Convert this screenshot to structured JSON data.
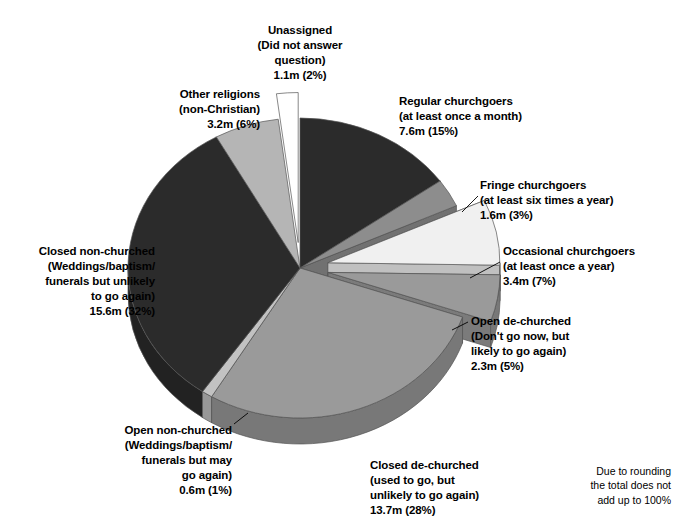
{
  "chart_data": {
    "type": "pie",
    "title": "",
    "subtitle": "",
    "xlabel": "",
    "ylabel": "",
    "legend_position": "callout-labels",
    "grid": false,
    "exploded": true,
    "three_d": true,
    "units": "millions of people",
    "start_angle_deg": 0,
    "direction": "clockwise",
    "categories": [
      "Regular churchgoers",
      "Fringe churchgoers",
      "Occasional churchgoers",
      "Open de-churched",
      "Closed de-churched",
      "Open non-churched",
      "Closed non-churched",
      "Other religions",
      "Unassigned"
    ],
    "values": [
      15,
      3,
      7,
      5,
      28,
      1,
      32,
      6,
      2
    ],
    "values_millions": [
      7.6,
      1.6,
      3.4,
      2.3,
      13.7,
      0.6,
      15.6,
      3.2,
      1.1
    ],
    "slices": [
      {
        "key": "regular-churchgoers",
        "name": "Regular churchgoers",
        "qualifier": "(at least once a month)",
        "amount": "7.6m",
        "percent": 15,
        "percent_label": "(15%)",
        "value_line": "7.6m (15%)",
        "color": "#2b2b2b",
        "side_color": "#1a1a1a",
        "exploded": false
      },
      {
        "key": "fringe-churchgoers",
        "name": "Fringe churchgoers",
        "qualifier": "(at least six times a year)",
        "amount": "1.6m",
        "percent": 3,
        "percent_label": "(3%)",
        "value_line": "1.6m (3%)",
        "color": "#8d8d8d",
        "side_color": "#6f6f6f",
        "exploded": false
      },
      {
        "key": "occasional-churchgoers",
        "name": "Occasional churchgoers",
        "qualifier": "(at least once a year)",
        "amount": "3.4m",
        "percent": 7,
        "percent_label": "(7%)",
        "value_line": "3.4m (7%)",
        "color": "#f0f0f0",
        "side_color": "#d2d2d2",
        "exploded": true
      },
      {
        "key": "open-de-churched",
        "name": "Open de-churched",
        "qualifier": "(Don't go now, but likely to go again)",
        "amount": "2.3m",
        "percent": 5,
        "percent_label": "(5%)",
        "value_line": "2.3m (5%)",
        "color": "#9a9a9a",
        "side_color": "#7c7c7c",
        "exploded": true
      },
      {
        "key": "closed-de-churched",
        "name": "Closed de-churched",
        "qualifier": "(used to go, but unlikely to go again)",
        "amount": "13.7m",
        "percent": 28,
        "percent_label": "(28%)",
        "value_line": "13.7m (28%)",
        "color": "#9a9a9a",
        "side_color": "#7c7c7c",
        "exploded": false
      },
      {
        "key": "open-non-churched",
        "name": "Open non-churched",
        "qualifier": "(Weddings/baptism/ funerals but may go again)",
        "amount": "0.6m",
        "percent": 1,
        "percent_label": "(1%)",
        "value_line": "0.6m (1%)",
        "color": "#c2c2c2",
        "side_color": "#a2a2a2",
        "exploded": false
      },
      {
        "key": "closed-non-churched",
        "name": "Closed non-churched",
        "qualifier": "(Weddings/baptism/ funerals but unlikely to go again)",
        "amount": "15.6m",
        "percent": 32,
        "percent_label": "(32%)",
        "value_line": "15.6m  (32%)",
        "color": "#2b2b2b",
        "side_color": "#1a1a1a",
        "exploded": false
      },
      {
        "key": "other-religions",
        "name": "Other religions",
        "qualifier": "(non-Christian)",
        "amount": "3.2m",
        "percent": 6,
        "percent_label": "(6%)",
        "value_line": "3.2m (6%)",
        "color": "#b5b5b5",
        "side_color": "#959595",
        "exploded": false
      },
      {
        "key": "unassigned",
        "name": "Unassigned",
        "qualifier": "(Did not answer question)",
        "amount": "1.1m",
        "percent": 2,
        "percent_label": "(2%)",
        "value_line": "1.1m (2%)",
        "color": "#ffffff",
        "side_color": "#e4e4e4",
        "exploded": true
      }
    ]
  },
  "labels": {
    "unassigned": "Unassigned\n(Did not answer\nquestion)\n1.1m (2%)",
    "other_religions": "Other religions\n(non-Christian)\n3.2m (6%)",
    "regular_churchgoers": "Regular churchgoers\n(at least once a month)\n7.6m (15%)",
    "fringe_churchgoers": "Fringe churchgoers\n(at least six times a year)\n1.6m (3%)",
    "occasional_churchgoers": "Occasional churchgoers\n(at least once a year)\n3.4m (7%)",
    "open_de_churched": "Open de-churched\n(Don't go now, but\nlikely to go again)\n2.3m (5%)",
    "closed_de_churched": "Closed de-churched\n(used to go, but\nunlikely to go again)\n13.7m (28%)",
    "open_non_churched": "Open non-churched\n(Weddings/baptism/\nfunerals but may\ngo again)\n0.6m (1%)",
    "closed_non_churched": "Closed non-churched\n(Weddings/baptism/\nfunerals but unlikely\nto go again)\n15.6m  (32%)"
  },
  "footnote": {
    "text": "Due to rounding\nthe total does not\nadd up to 100%"
  },
  "palette": {
    "dark": "#2b2b2b",
    "mid_grey": "#9a9a9a",
    "light_grey": "#b5b5b5",
    "pale": "#f0f0f0",
    "white": "#ffffff",
    "outline": "#555555",
    "background": "#ffffff"
  }
}
